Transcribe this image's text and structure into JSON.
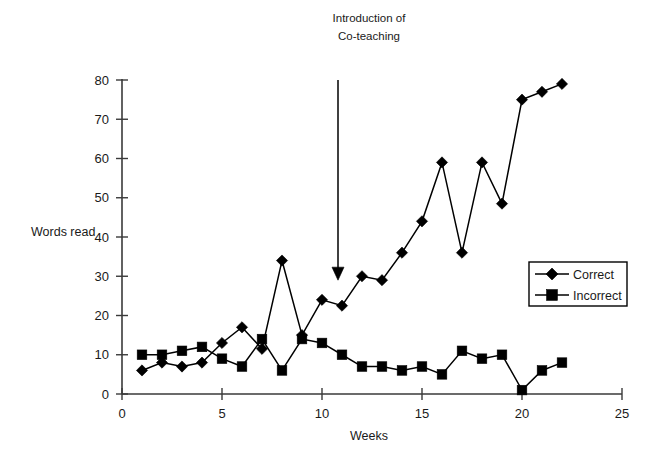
{
  "chart_data": {
    "type": "line",
    "title": "",
    "xlabel": "Weeks",
    "ylabel": "Words read",
    "xlim": [
      0,
      25
    ],
    "ylim": [
      0,
      80
    ],
    "xticks": [
      "0",
      "5",
      "10",
      "15",
      "20",
      "25"
    ],
    "yticks": [
      "0",
      "10",
      "20",
      "30",
      "40",
      "50",
      "60",
      "70",
      "80"
    ],
    "grid": false,
    "legend_position": "right-middle",
    "x": [
      1,
      2,
      3,
      4,
      5,
      6,
      7,
      8,
      9,
      10,
      11,
      12,
      13,
      14,
      15,
      16,
      17,
      18,
      19,
      20,
      21,
      22
    ],
    "series": [
      {
        "name": "Correct",
        "marker": "diamond",
        "values": [
          6,
          8,
          7,
          8,
          13,
          17,
          11.5,
          34,
          15,
          24,
          22.5,
          30,
          29,
          36,
          44,
          59,
          36,
          59,
          48.5,
          75,
          77,
          79
        ]
      },
      {
        "name": "Incorrect",
        "marker": "square",
        "values": [
          10,
          10,
          11,
          12,
          9,
          7,
          14,
          6,
          14,
          13,
          10,
          7,
          7,
          6,
          7,
          5,
          11,
          9,
          10,
          1,
          6,
          8
        ]
      }
    ],
    "annotations": [
      {
        "id": "intro-coteaching",
        "line1": "Introduction of",
        "line2": "Co-teaching",
        "arrow_x_week": 10.8,
        "arrow_from_value": 80,
        "arrow_to_value": 29
      }
    ]
  },
  "legend": {
    "entries": [
      {
        "label": "Correct",
        "marker": "diamond"
      },
      {
        "label": "Incorrect",
        "marker": "square"
      }
    ]
  },
  "colors": {
    "series": "#000000",
    "axis": "#3a3a3a",
    "text": "#1a1a1a",
    "background": "#ffffff"
  }
}
